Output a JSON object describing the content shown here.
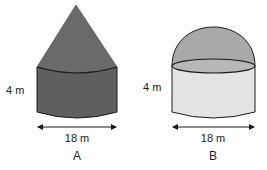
{
  "figures": [
    {
      "id": "A",
      "label": "A",
      "shape": "cylinder with cone on top",
      "height_label": "4 m",
      "width_label": "18 m",
      "colors": {
        "cone": "#6a6a6a",
        "cylinder": "#5f5f5f",
        "outline": "#1a1a1a"
      }
    },
    {
      "id": "B",
      "label": "B",
      "shape": "cylinder with hemisphere on top",
      "height_label": "4 m",
      "width_label": "18 m",
      "colors": {
        "dome": "#a9a9a9",
        "cylinder": "#e4e4e4",
        "ellipse_top": "#b8b8b8",
        "outline": "#1a1a1a"
      }
    }
  ]
}
